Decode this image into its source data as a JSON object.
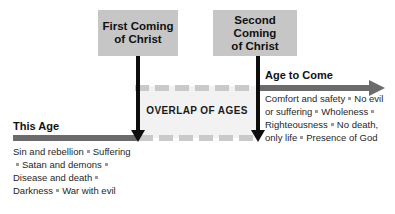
{
  "diagram": {
    "title": "Overlap of Ages",
    "overlap_label": "OVERLAP OF AGES",
    "events": [
      {
        "label_line1": "First Coming",
        "label_line2": "of Christ"
      },
      {
        "label_line1": "Second Coming",
        "label_line2": "of Christ"
      }
    ],
    "ages": [
      {
        "heading": "This Age",
        "attributes": [
          "Sin and rebellion",
          "Suffering",
          "Satan and demons",
          "Disease and death",
          "Darkness",
          "War with evil"
        ]
      },
      {
        "heading": "Age to Come",
        "attributes": [
          "Comfort and safety",
          "No evil or suffering",
          "Wholeness",
          "Righteousness",
          "No death, only life",
          "Presence of God"
        ]
      }
    ],
    "colors": {
      "box_fill": "#c6c6c6",
      "bar_solid": "#6b6b6b",
      "bar_dashed": "#c9c9c9",
      "overlap_fill": "#f2f2f2",
      "arrow": "#0d0d0d",
      "text": "#1f1f1f"
    }
  }
}
